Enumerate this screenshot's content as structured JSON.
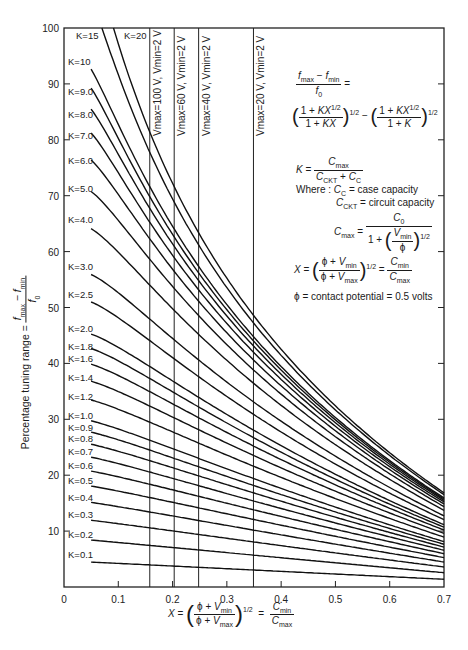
{
  "chart_data": {
    "type": "line",
    "title": "",
    "xlabel": "X = ((φ + Vmin)/(φ + Vmax))^1/2 = Cmin/Cmax",
    "ylabel": "Percentage tuning range = (fmax − fmin)/f0",
    "xlim": [
      0,
      0.7
    ],
    "ylim": [
      0,
      100
    ],
    "x_ticks": [
      0,
      0.1,
      0.2,
      0.3,
      0.4,
      0.5,
      0.6,
      0.7
    ],
    "x_tick_labels": [
      "0",
      "0.1",
      "0.2",
      "0.3",
      "0.4",
      "0.5",
      "0.6",
      "0.7"
    ],
    "y_ticks": [
      10,
      20,
      30,
      40,
      50,
      60,
      70,
      80,
      90,
      100
    ],
    "y_tick_labels": [
      "10",
      "20",
      "30",
      "40",
      "50",
      "60",
      "70",
      "80",
      "90",
      "100"
    ],
    "grid": false,
    "formula": "100 * [ ((1+K·X^1/2)/(1+K·X))^1/2 − ((1+K·X^1/2)/(1+K))^1/2 ]",
    "x_start": 0.05,
    "x_end": 0.7,
    "series": [
      {
        "name": "K=0.1",
        "K": 0.1,
        "label_y": 5.8,
        "values_at": {
          "0.05": 4.5,
          "0.7": 0.9
        }
      },
      {
        "name": "K=0.2",
        "K": 0.2,
        "label_y": 9.3,
        "values_at": {
          "0.05": 8.1,
          "0.7": 1.7
        }
      },
      {
        "name": "K=0.3",
        "K": 0.3,
        "label_y": 12.8,
        "values_at": {
          "0.05": 11.1,
          "0.7": 2.4
        }
      },
      {
        "name": "K=0.4",
        "K": 0.4,
        "label_y": 16.0,
        "values_at": {
          "0.05": 13.7,
          "0.7": 3.1
        }
      },
      {
        "name": "K=0.5",
        "K": 0.5,
        "label_y": 19.0,
        "values_at": {
          "0.05": 16.0,
          "0.7": 3.7
        }
      },
      {
        "name": "K=0.6",
        "K": 0.6,
        "label_y": 21.6,
        "values_at": {
          "0.05": 18.1,
          "0.7": 4.3
        }
      },
      {
        "name": "K=0.7",
        "K": 0.7,
        "label_y": 24.2,
        "values_at": {
          "0.05": 20.0,
          "0.7": 4.9
        }
      },
      {
        "name": "K=0.8",
        "K": 0.8,
        "label_y": 26.4,
        "values_at": {
          "0.05": 21.8,
          "0.7": 5.4
        }
      },
      {
        "name": "K=0.9",
        "K": 0.9,
        "label_y": 28.4,
        "values_at": {
          "0.05": 23.4,
          "0.7": 5.9
        }
      },
      {
        "name": "K=1.0",
        "K": 1.0,
        "label_y": 30.6,
        "values_at": {
          "0.05": 29.7,
          "0.7": 6.4
        }
      },
      {
        "name": "K=1.2",
        "K": 1.2,
        "label_y": 34.0,
        "values_at": {
          "0.05": 32.5,
          "0.7": 7.3
        }
      },
      {
        "name": "K=1.4",
        "K": 1.4,
        "label_y": 37.4,
        "values_at": {
          "0.05": 35.0,
          "0.7": 8.1
        }
      },
      {
        "name": "K=1.6",
        "K": 1.6,
        "label_y": 40.8,
        "values_at": {
          "0.05": 37.3,
          "0.7": 8.8
        }
      },
      {
        "name": "K=1.8",
        "K": 1.8,
        "label_y": 43.0,
        "values_at": {
          "0.05": 39.4,
          "0.7": 9.5
        }
      },
      {
        "name": "K=2.0",
        "K": 2.0,
        "label_y": 46.2,
        "values_at": {
          "0.05": 41.4,
          "0.7": 10.1
        }
      },
      {
        "name": "K=2.5",
        "K": 2.5,
        "label_y": 52.2,
        "values_at": {
          "0.05": 45.8,
          "0.7": 11.5
        }
      },
      {
        "name": "K=3.0",
        "K": 3.0,
        "label_y": 57.2,
        "values_at": {
          "0.05": 49.6,
          "0.7": 12.6
        }
      },
      {
        "name": "K=4.0",
        "K": 4.0,
        "label_y": 65.6,
        "values_at": {
          "0.05": 55.9,
          "0.7": 14.4
        }
      },
      {
        "name": "K=5.0",
        "K": 5.0,
        "label_y": 71.2,
        "values_at": {
          "0.05": 61.0,
          "0.7": 15.8
        }
      },
      {
        "name": "K=6.0",
        "K": 6.0,
        "label_y": 76.2,
        "values_at": {
          "0.05": 65.4,
          "0.7": 16.9
        }
      },
      {
        "name": "K=7.0",
        "K": 7.0,
        "label_y": 80.6,
        "values_at": {
          "0.05": 69.1,
          "0.7": 17.8
        }
      },
      {
        "name": "K=8.0",
        "K": 8.0,
        "label_y": 84.4,
        "values_at": {
          "0.05": 72.5,
          "0.7": 18.6
        }
      },
      {
        "name": "K=9.0",
        "K": 9.0,
        "label_y": 88.6,
        "values_at": {
          "0.05": 75.6,
          "0.7": 19.3
        }
      },
      {
        "name": "K=10",
        "K": 10,
        "label_y": 94.0,
        "values_at": {
          "0.05": 78.4,
          "0.7": 19.9
        }
      },
      {
        "name": "K=15",
        "K": 15,
        "label_y": 98.6,
        "values_at": {
          "0.066": 100,
          "0.7": 22.3
        }
      },
      {
        "name": "K=20",
        "K": 20,
        "label_y": 98.6,
        "values_at": {
          "0.1": 100,
          "0.7": 23.9
        }
      }
    ],
    "vertical_lines": [
      {
        "x": 0.158,
        "label": "Vmax=100 V, Vmin=2 V"
      },
      {
        "x": 0.203,
        "label": "Vmax=60 V, Vmin=2 V"
      },
      {
        "x": 0.248,
        "label": "Vmax=40 V, Vmin=2 V"
      },
      {
        "x": 0.349,
        "label": "Vmax=20 V, Vmin=2 V"
      }
    ],
    "annotations": [
      "(fmax − fmin)/f0 = ((1+KX^1/2)/(1+KX))^1/2 − ((1+KX^1/2)/(1+K))^1/2",
      "K = Cmax/(CCKT + CC)",
      "Where: CC = case capacity",
      "CCKT = circuit capacity",
      "Cmax = C0 / (1 + (Vmin/φ)^1/2)",
      "X = ((φ+Vmin)/(φ+Vmax))^1/2 = Cmin/Cmax",
      "φ = contact potential = 0.5 volts"
    ]
  },
  "labels": {
    "ylabel_text": "Percentage tuning range =",
    "ylabel_frac_num": "f",
    "ylabel_frac_num_sub1": "max",
    "ylabel_frac_num_mid": " − f",
    "ylabel_frac_num_sub2": "min",
    "ylabel_frac_den": "f",
    "ylabel_frac_den_sub": "0",
    "where_text": "Where :",
    "cc_label": "= case capacity",
    "cckt_label": "= circuit capacity",
    "phi_text": "ϕ = contact potential = 0.5 volts"
  }
}
